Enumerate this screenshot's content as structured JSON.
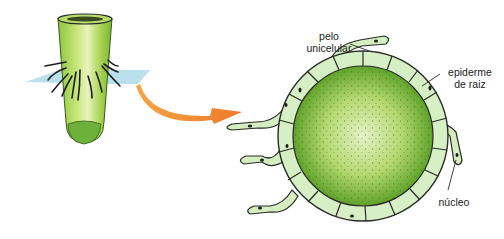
{
  "diagram": {
    "labels": {
      "hair": {
        "line1": "pelo",
        "line2": "unicelular"
      },
      "epidermis": {
        "line1": "epiderme",
        "line2": "de raiz"
      },
      "nucleus": "núcleo"
    },
    "colors": {
      "root_green": "#a9d24a",
      "root_dark": "#6aa72a",
      "epidermis_cell": "#d8f0c8",
      "cortex_green": "#7cbb3c",
      "cortex_center": "#cfe8a8",
      "arrow_orange": "#f08a30",
      "plane_blue": "#a9d8e8",
      "outline": "#2a2a2a"
    }
  }
}
